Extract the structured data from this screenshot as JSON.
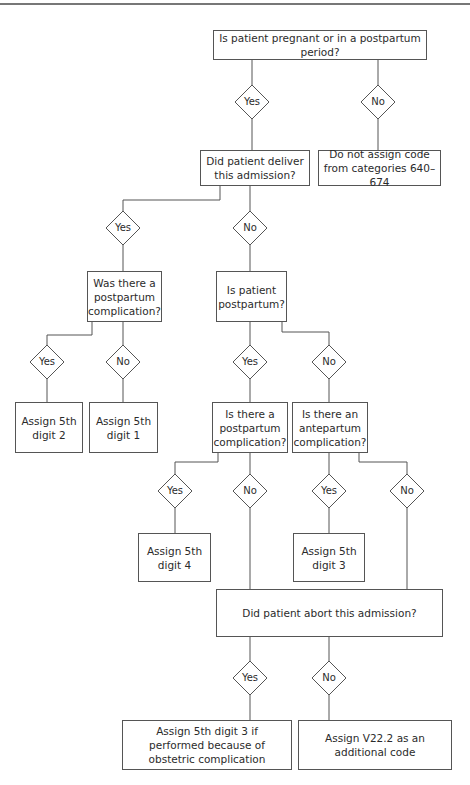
{
  "diagram": {
    "line_color": "#555555",
    "nodes": [
      {
        "id": "q_pregnant",
        "type": "decision_box",
        "text": "Is patient pregnant or in a postpartum period?",
        "x": 213,
        "y": 30,
        "w": 214,
        "h": 30
      },
      {
        "id": "d1_yes",
        "type": "diamond",
        "text": "Yes",
        "cx": 252,
        "cy": 102
      },
      {
        "id": "d1_no",
        "type": "diamond",
        "text": "No",
        "cx": 378,
        "cy": 102
      },
      {
        "id": "q_deliver",
        "type": "decision_box",
        "text": "Did patient deliver this admission?",
        "x": 200,
        "y": 150,
        "w": 110,
        "h": 36
      },
      {
        "id": "a_no_code",
        "type": "action_box",
        "text": "Do not assign code from categories 640–674",
        "x": 318,
        "y": 150,
        "w": 123,
        "h": 36
      },
      {
        "id": "d2_yes",
        "type": "diamond",
        "text": "Yes",
        "cx": 123,
        "cy": 228
      },
      {
        "id": "d2_no",
        "type": "diamond",
        "text": "No",
        "cx": 250,
        "cy": 228
      },
      {
        "id": "q_pp_comp",
        "type": "decision_box",
        "text": "Was there a postpartum complication?",
        "x": 87,
        "y": 271,
        "w": 75,
        "h": 51
      },
      {
        "id": "q_is_pp",
        "type": "decision_box",
        "text": "Is patient postpartum?",
        "x": 216,
        "y": 271,
        "w": 71,
        "h": 51
      },
      {
        "id": "d3_yes_a",
        "type": "diamond",
        "text": "Yes",
        "cx": 47,
        "cy": 362
      },
      {
        "id": "d3_no_a",
        "type": "diamond",
        "text": "No",
        "cx": 123,
        "cy": 362
      },
      {
        "id": "d3_yes_b",
        "type": "diamond",
        "text": "Yes",
        "cx": 250,
        "cy": 362
      },
      {
        "id": "d3_no_b",
        "type": "diamond",
        "text": "No",
        "cx": 329,
        "cy": 362
      },
      {
        "id": "a_digit2",
        "type": "action_box",
        "text": "Assign 5th digit 2",
        "x": 15,
        "y": 402,
        "w": 68,
        "h": 51
      },
      {
        "id": "a_digit1",
        "type": "action_box",
        "text": "Assign 5th digit 1",
        "x": 89,
        "y": 402,
        "w": 69,
        "h": 51
      },
      {
        "id": "q_pp_comp2",
        "type": "decision_box",
        "text": "Is there a postpartum complication?",
        "x": 212,
        "y": 402,
        "w": 76,
        "h": 51
      },
      {
        "id": "q_ante_comp",
        "type": "decision_box",
        "text": "Is there an antepartum complication?",
        "x": 292,
        "y": 402,
        "w": 76,
        "h": 51
      },
      {
        "id": "d4_yes_a",
        "type": "diamond",
        "text": "Yes",
        "cx": 175,
        "cy": 491
      },
      {
        "id": "d4_no_a",
        "type": "diamond",
        "text": "No",
        "cx": 250,
        "cy": 491
      },
      {
        "id": "d4_yes_b",
        "type": "diamond",
        "text": "Yes",
        "cx": 329,
        "cy": 491
      },
      {
        "id": "d4_no_b",
        "type": "diamond",
        "text": "No",
        "cx": 407,
        "cy": 491
      },
      {
        "id": "a_digit4",
        "type": "action_box",
        "text": "Assign 5th digit 4",
        "x": 138,
        "y": 533,
        "w": 73,
        "h": 49
      },
      {
        "id": "a_digit3",
        "type": "action_box",
        "text": "Assign 5th digit 3",
        "x": 293,
        "y": 533,
        "w": 72,
        "h": 49
      },
      {
        "id": "q_abort",
        "type": "decision_box",
        "text": "Did patient abort this admission?",
        "x": 216,
        "y": 589,
        "w": 227,
        "h": 48
      },
      {
        "id": "d5_yes",
        "type": "diamond",
        "text": "Yes",
        "cx": 250,
        "cy": 678
      },
      {
        "id": "d5_no",
        "type": "diamond",
        "text": "No",
        "cx": 329,
        "cy": 678
      },
      {
        "id": "a_digit3_abort",
        "type": "action_box",
        "text": "Assign 5th digit 3 if performed because of obstetric complication",
        "x": 122,
        "y": 720,
        "w": 170,
        "h": 50
      },
      {
        "id": "a_v222",
        "type": "action_box",
        "text": "Assign V22.2 as an additional code",
        "x": 298,
        "y": 720,
        "w": 154,
        "h": 50
      }
    ],
    "edges": [
      [
        [
          252,
          60
        ],
        [
          252,
          85
        ]
      ],
      [
        [
          378,
          60
        ],
        [
          378,
          85
        ]
      ],
      [
        [
          252,
          119
        ],
        [
          252,
          150
        ]
      ],
      [
        [
          378,
          119
        ],
        [
          378,
          150
        ]
      ],
      [
        [
          220,
          186
        ],
        [
          220,
          200
        ],
        [
          123,
          200
        ],
        [
          123,
          211
        ]
      ],
      [
        [
          250,
          186
        ],
        [
          250,
          211
        ]
      ],
      [
        [
          123,
          245
        ],
        [
          123,
          271
        ]
      ],
      [
        [
          250,
          245
        ],
        [
          250,
          271
        ]
      ],
      [
        [
          92,
          322
        ],
        [
          92,
          335
        ],
        [
          47,
          335
        ],
        [
          47,
          345
        ]
      ],
      [
        [
          123,
          322
        ],
        [
          123,
          345
        ]
      ],
      [
        [
          250,
          322
        ],
        [
          250,
          345
        ]
      ],
      [
        [
          282,
          322
        ],
        [
          282,
          332
        ],
        [
          329,
          332
        ],
        [
          329,
          345
        ]
      ],
      [
        [
          47,
          379
        ],
        [
          47,
          402
        ]
      ],
      [
        [
          123,
          379
        ],
        [
          123,
          402
        ]
      ],
      [
        [
          250,
          379
        ],
        [
          250,
          402
        ]
      ],
      [
        [
          329,
          379
        ],
        [
          329,
          402
        ]
      ],
      [
        [
          218,
          453
        ],
        [
          218,
          462
        ],
        [
          175,
          462
        ],
        [
          175,
          474
        ]
      ],
      [
        [
          250,
          453
        ],
        [
          250,
          474
        ]
      ],
      [
        [
          329,
          453
        ],
        [
          329,
          474
        ]
      ],
      [
        [
          359,
          453
        ],
        [
          359,
          462
        ],
        [
          407,
          462
        ],
        [
          407,
          474
        ]
      ],
      [
        [
          175,
          508
        ],
        [
          175,
          533
        ]
      ],
      [
        [
          329,
          508
        ],
        [
          329,
          533
        ]
      ],
      [
        [
          250,
          508
        ],
        [
          250,
          589
        ]
      ],
      [
        [
          407,
          508
        ],
        [
          407,
          589
        ]
      ],
      [
        [
          250,
          637
        ],
        [
          250,
          661
        ]
      ],
      [
        [
          329,
          637
        ],
        [
          329,
          661
        ]
      ],
      [
        [
          250,
          695
        ],
        [
          250,
          720
        ]
      ],
      [
        [
          329,
          695
        ],
        [
          329,
          720
        ]
      ]
    ]
  }
}
